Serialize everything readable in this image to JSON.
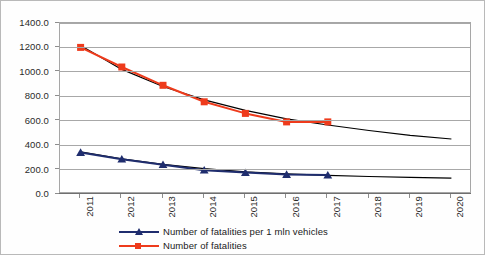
{
  "chart_data": {
    "type": "line",
    "title": "",
    "xlabel": "",
    "ylabel": "",
    "categories": [
      "2011",
      "2012",
      "2013",
      "2014",
      "2015",
      "2016",
      "2017",
      "2018",
      "2019",
      "2020"
    ],
    "ylim": [
      0,
      1400
    ],
    "yticks": [
      "0.0",
      "200.0",
      "400.0",
      "600.0",
      "800.0",
      "1000.0",
      "1200.0",
      "1400.0"
    ],
    "ytick_values": [
      0,
      200,
      400,
      600,
      800,
      1000,
      1200,
      1400
    ],
    "grid": true,
    "legend_position": "bottom",
    "series": [
      {
        "name": "Number of fatalities per 1 mln vehicles",
        "color": "#1F2D6E",
        "marker": "triangle",
        "values": [
          340,
          285,
          240,
          195,
          175,
          160,
          155,
          null,
          null,
          null
        ]
      },
      {
        "name": "Number of fatalities",
        "color": "#EE3B1C",
        "marker": "square",
        "values": [
          1200,
          1040,
          890,
          755,
          660,
          590,
          590,
          null,
          null,
          null
        ]
      }
    ],
    "trendlines": [
      {
        "name": "Number of fatalities trendline",
        "color": "#000000",
        "values": [
          1215,
          1020,
          880,
          770,
          685,
          615,
          565,
          520,
          480,
          450
        ]
      },
      {
        "name": "Number of fatalities per 1 mln vehicles trendline",
        "color": "#000000",
        "values": [
          345,
          288,
          243,
          208,
          182,
          165,
          152,
          143,
          136,
          130
        ]
      }
    ]
  },
  "legend": {
    "items": [
      {
        "label": "Number of fatalities per 1 mln vehicles",
        "color": "#1F2D6E",
        "marker": "triangle"
      },
      {
        "label": "Number of fatalities",
        "color": "#EE3B1C",
        "marker": "square"
      }
    ]
  }
}
